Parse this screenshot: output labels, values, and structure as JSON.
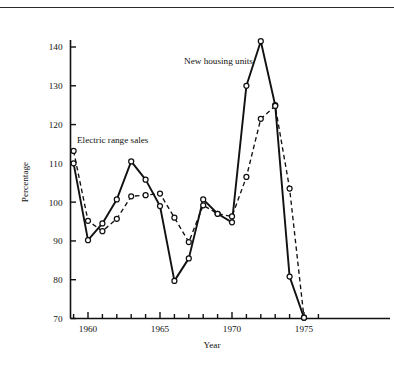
{
  "figure": {
    "clipped_caption": "Chart 2.",
    "percentage_axis_label": "Percentage",
    "year_axis_label": "Year"
  },
  "annotations": {
    "electric_range_sales": "Electric range sales",
    "new_housing_units": "New housing units"
  },
  "axes": {
    "y_ticks": [
      "70",
      "80",
      "90",
      "100",
      "110",
      "120",
      "130",
      "140"
    ],
    "x_ticks": [
      "1960",
      "1965",
      "1970",
      "1975"
    ]
  },
  "chart_data": {
    "type": "line",
    "title": "",
    "xlabel": "Year",
    "ylabel": "Percentage",
    "xlim": [
      1958.6,
      1976.2
    ],
    "ylim": [
      70,
      144
    ],
    "ytick_values": [
      70,
      80,
      90,
      100,
      110,
      120,
      130,
      140
    ],
    "xtick_values": [
      1960,
      1965,
      1970,
      1975
    ],
    "x_minor_ticks_every": 1,
    "grid": false,
    "legend_position": "inline-annotations",
    "x": [
      1959,
      1960,
      1961,
      1962,
      1963,
      1964,
      1965,
      1966,
      1967,
      1968,
      1969,
      1970,
      1971,
      1972,
      1973,
      1974,
      1975
    ],
    "series": [
      {
        "name": "New housing units",
        "style": "solid",
        "marker": "open-circle",
        "values": [
          110.0,
          90.2,
          94.5,
          100.7,
          110.5,
          105.8,
          99.0,
          79.7,
          85.5,
          100.7,
          97.0,
          94.8,
          130.0,
          141.5,
          125.0,
          80.8,
          70.2
        ]
      },
      {
        "name": "Electric range sales",
        "style": "dashed",
        "marker": "open-circle",
        "values": [
          113.2,
          95.2,
          92.5,
          95.7,
          101.5,
          101.8,
          102.2,
          96.0,
          89.7,
          99.2,
          97.0,
          96.3,
          106.5,
          121.5,
          124.8,
          103.5,
          70.2
        ]
      }
    ]
  }
}
